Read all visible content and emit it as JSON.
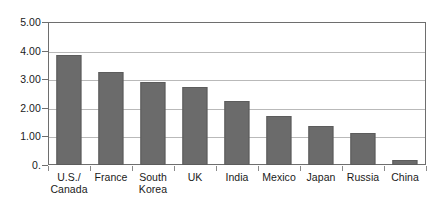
{
  "chart_data": {
    "type": "bar",
    "title": "",
    "subtitle": "",
    "xlabel": "",
    "ylabel": "",
    "categories": [
      "U.S./ Canada",
      "France",
      "South Korea",
      "UK",
      "India",
      "Mexico",
      "Japan",
      "Russia",
      "China"
    ],
    "category_lines": [
      [
        "U.S./",
        "Canada"
      ],
      [
        "France"
      ],
      [
        "South",
        "Korea"
      ],
      [
        "UK"
      ],
      [
        "India"
      ],
      [
        "Mexico"
      ],
      [
        "Japan"
      ],
      [
        "Russia"
      ],
      [
        "China"
      ]
    ],
    "values": [
      3.85,
      3.24,
      2.92,
      2.72,
      2.25,
      1.73,
      1.35,
      1.13,
      0.18
    ],
    "ylim": [
      0,
      5
    ],
    "yticks": [
      5,
      4,
      3,
      2,
      1,
      0
    ],
    "ytick_labels": [
      "5.00",
      "4.00",
      "3.00",
      "2.00",
      "1.00",
      "0."
    ],
    "grid": true,
    "legend": "none",
    "bar_color": "#6b6b6b",
    "gridline_color": "#b9b9b9",
    "frame_color": "#6e6e6e",
    "background_color": "#ffffff",
    "text_color": "#1a1a1a"
  }
}
